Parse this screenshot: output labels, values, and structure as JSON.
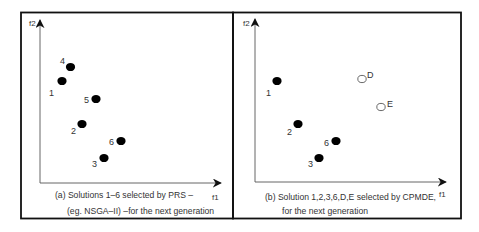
{
  "panels": [
    {
      "id": "a",
      "caption_line1": "(a) Solutions 1–6 selected by PRS –",
      "caption_line2": "(eg. NSGA–II) –for the next generation",
      "x_axis_label": "f1",
      "y_axis_label": "f2",
      "points": [
        {
          "label": "4",
          "type": "filled"
        },
        {
          "label": "1",
          "type": "filled"
        },
        {
          "label": "5",
          "type": "filled"
        },
        {
          "label": "2",
          "type": "filled"
        },
        {
          "label": "6",
          "type": "filled"
        },
        {
          "label": "3",
          "type": "filled"
        }
      ]
    },
    {
      "id": "b",
      "caption_line1": "(b) Solution 1,2,3,6,D,E selected by CPMDE,",
      "caption_line2": "for the next generation",
      "x_axis_label": "f1",
      "y_axis_label": "f2",
      "points": [
        {
          "label": "1",
          "type": "filled"
        },
        {
          "label": "D",
          "type": "open"
        },
        {
          "label": "E",
          "type": "open"
        },
        {
          "label": "2",
          "type": "filled"
        },
        {
          "label": "6",
          "type": "filled"
        },
        {
          "label": "3",
          "type": "filled"
        }
      ]
    }
  ],
  "colors": {
    "frame": "#111111",
    "axis": "#444444",
    "point_fill": "#000000",
    "open_point_stroke": "#444444"
  }
}
